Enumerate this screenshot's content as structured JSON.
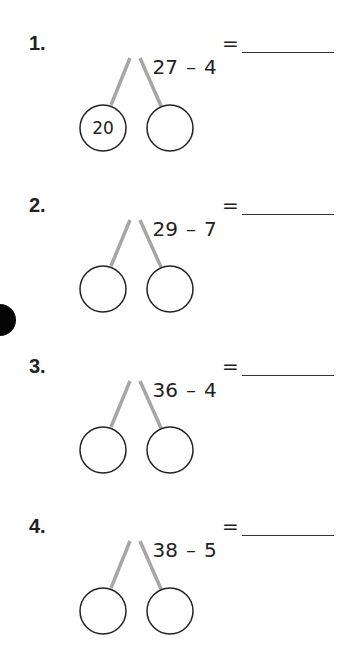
{
  "worksheet": {
    "problems": [
      {
        "number": "1.",
        "minuend": "27",
        "operator": "–",
        "subtrahend": "4",
        "equals": "=",
        "answer": "",
        "left_part": "20",
        "right_part": ""
      },
      {
        "number": "2.",
        "minuend": "29",
        "operator": "–",
        "subtrahend": "7",
        "equals": "=",
        "answer": "",
        "left_part": "",
        "right_part": ""
      },
      {
        "number": "3.",
        "minuend": "36",
        "operator": "–",
        "subtrahend": "4",
        "equals": "=",
        "answer": "",
        "left_part": "",
        "right_part": ""
      },
      {
        "number": "4.",
        "minuend": "38",
        "operator": "–",
        "subtrahend": "5",
        "equals": "=",
        "answer": "",
        "left_part": "",
        "right_part": ""
      }
    ],
    "colors": {
      "ink": "#222222",
      "bond_line": "#a6a6a6",
      "hole_punch": "#050505"
    }
  }
}
